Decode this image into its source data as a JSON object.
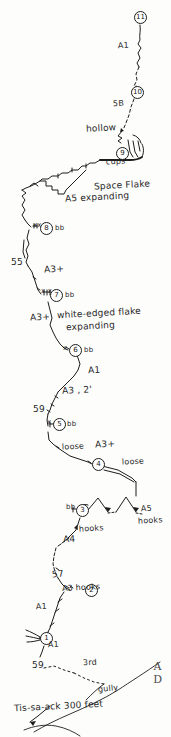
{
  "drawing": {
    "kind": "hand-drawn-climbing-topo",
    "route_name": "Tis-sa-ack",
    "scale_note": "300 feet",
    "corner_letters": [
      "A",
      "D"
    ],
    "ink_color": "#1d1d1d",
    "paper_color": "#fdfdfc"
  },
  "belays": [
    {
      "id": "1",
      "label": "1"
    },
    {
      "id": "2",
      "label": "2"
    },
    {
      "id": "3",
      "label": "3"
    },
    {
      "id": "4",
      "label": "4"
    },
    {
      "id": "5",
      "label": "5"
    },
    {
      "id": "6",
      "label": "6"
    },
    {
      "id": "7",
      "label": "7"
    },
    {
      "id": "8",
      "label": "8"
    },
    {
      "id": "9",
      "label": "9"
    },
    {
      "id": "10",
      "label": "10"
    },
    {
      "id": "11",
      "label": "11"
    }
  ],
  "annotations": {
    "a1_top": "A1",
    "grade_5_8": "5B",
    "hollow": "hollow",
    "cups": "cups",
    "space_flake": "Space Flake",
    "a5_expanding": "A5 expanding",
    "bb_8": "bb",
    "bb_8_left": "xx",
    "grade_55": "55",
    "a3_plus_upper": "A3+",
    "bb_7": "bb",
    "bb_7_left": "x x",
    "a3_plus_mid": "A3+",
    "white_edged_flake": "white-edged flake",
    "expanding": "expanding",
    "bb_6": "bb",
    "bb_6_left": "x",
    "a1_mid": "A1",
    "a3_2ft": "A3 , 2'",
    "grade_59_upper": "59",
    "bb_5": "bb",
    "bb_5_left": "x",
    "loose_left": "loose",
    "a3_plus_lower": "A3+",
    "loose_right": "loose",
    "bb_3_left": "bb",
    "a5": "A5",
    "hooks_right": "hooks",
    "hooks_mid": "hooks",
    "a4": "A4",
    "grade_57": "57",
    "a3_hooks": "A3 hooks",
    "a1_lower": "A1",
    "a1_below_belay1": "A1",
    "grade_59_lower": "59",
    "third_class": "3rd",
    "gully": "gully",
    "route_and_scale": "Tis-sa-ack  300 feet"
  }
}
